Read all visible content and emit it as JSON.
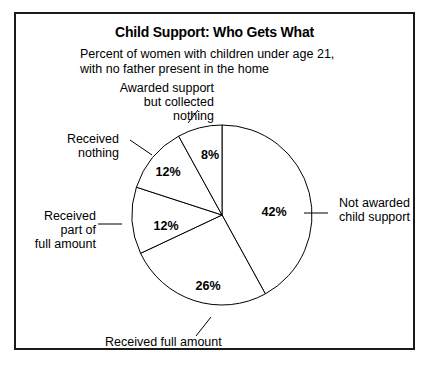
{
  "chart_data": {
    "type": "pie",
    "title": "Child Support: Who Gets What",
    "subtitle": "Percent of women with children under age 21,\nwith no father present in the home",
    "xlabel": "",
    "ylabel": "",
    "grid": false,
    "legend_position": "callout-labels",
    "units": "percent",
    "start_angle_deg": 0,
    "direction": "clockwise",
    "categories": [
      "Not awarded child support",
      "Received full amount",
      "Received part of full amount",
      "Received nothing",
      "Awarded support but collected nothing"
    ],
    "values": [
      42,
      26,
      12,
      12,
      8
    ],
    "value_labels": [
      "42%",
      "26%",
      "12%",
      "12%",
      "8%"
    ],
    "slices": [
      {
        "label": "Not awarded child support",
        "value": 42,
        "value_label": "42%",
        "pct_label_x": 258,
        "pct_label_y": 202,
        "cat_label_x": 323,
        "cat_label_y": 193,
        "cat_label_anchor": "start",
        "leader": {
          "x1": 288,
          "y1": 199,
          "x2": 312,
          "y2": 199
        }
      },
      {
        "label": "Received full amount",
        "value": 26,
        "value_label": "26%",
        "pct_label_x": 192,
        "pct_label_y": 276,
        "cat_label_x": 89,
        "cat_label_y": 332,
        "cat_label_anchor": "start",
        "leader": {
          "x1": 195,
          "y1": 303,
          "x2": 180,
          "y2": 322
        }
      },
      {
        "label": "Received part of full amount",
        "value": 12,
        "value_label": "12%",
        "pct_label_x": 150,
        "pct_label_y": 216,
        "cat_label_x": 80,
        "cat_label_y": 206,
        "cat_label_anchor": "end",
        "leader": {
          "x1": 82,
          "y1": 210,
          "x2": 106,
          "y2": 210
        }
      },
      {
        "label": "Received nothing",
        "value": 12,
        "value_label": "12%",
        "pct_label_x": 152,
        "pct_label_y": 162,
        "cat_label_x": 103,
        "cat_label_y": 129,
        "cat_label_anchor": "end",
        "leader": {
          "x1": 114,
          "y1": 126,
          "x2": 136,
          "y2": 141
        }
      },
      {
        "label": "Awarded support but collected nothing",
        "value": 8,
        "value_label": "8%",
        "pct_label_x": 194,
        "pct_label_y": 145,
        "cat_label_x": 198,
        "cat_label_y": 78,
        "cat_label_anchor": "end",
        "leader": {
          "x1": 182,
          "y1": 96,
          "x2": 172,
          "y2": 109
        }
      }
    ],
    "geometry": {
      "cx": 206,
      "cy": 201,
      "r": 90
    },
    "category_label_lines": {
      "Not awarded child support": [
        "Not awarded",
        "child support"
      ],
      "Received full amount": [
        "Received full amount"
      ],
      "Received part of full amount": [
        "Received",
        "part of",
        "full amount"
      ],
      "Received nothing": [
        "Received",
        "nothing"
      ],
      "Awarded support but collected nothing": [
        "Awarded support",
        "but collected",
        "nothing"
      ]
    },
    "colors": {
      "slice_fill": "#ffffff",
      "stroke": "#000000",
      "frame": "#1a1a1a",
      "text": "#000000"
    }
  }
}
